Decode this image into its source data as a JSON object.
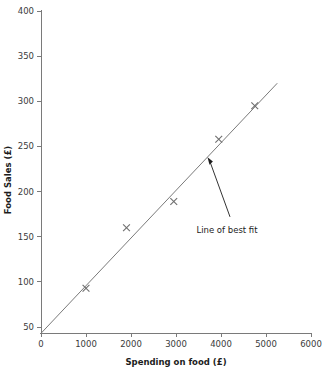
{
  "chart_data": {
    "type": "scatter",
    "title": "",
    "xlabel": "Spending on food (£)",
    "ylabel": "Food Sales (£)",
    "xlim": [
      0,
      6000
    ],
    "ylim": [
      43,
      400
    ],
    "grid": false,
    "legend": "none",
    "x_ticks": [
      0,
      1000,
      2000,
      3000,
      4000,
      5000,
      6000
    ],
    "x_tick_labels": [
      "0",
      "1000",
      "2000",
      "3000",
      "4000",
      "5000",
      "6000"
    ],
    "y_ticks": [
      50,
      100,
      150,
      200,
      250,
      300,
      350,
      400
    ],
    "y_tick_labels": [
      "50",
      "100",
      "150",
      "200",
      "250",
      "300",
      "350",
      "400"
    ],
    "marker": "x",
    "points": [
      {
        "x": 1000,
        "y": 93
      },
      {
        "x": 1900,
        "y": 160
      },
      {
        "x": 2950,
        "y": 189
      },
      {
        "x": 3950,
        "y": 258
      },
      {
        "x": 4750,
        "y": 295
      }
    ],
    "series": [
      {
        "name": "Observations",
        "x": [
          1000,
          1900,
          2950,
          3950,
          4750
        ],
        "values": [
          93,
          160,
          189,
          258,
          295
        ]
      }
    ],
    "trendline": {
      "name": "Line of best fit",
      "x_start": 0,
      "y_start": 43,
      "x_end": 5250,
      "y_end": 320
    },
    "annotations": [
      {
        "text": "Line of best fit",
        "target_x": 3700,
        "target_y": 238,
        "label_x": 4200,
        "label_y": 172
      }
    ],
    "colors": {
      "axis": "#7a7a7a",
      "marker": "#6e6e6e",
      "line": "#7a7a7a",
      "text": "#1c1c1c",
      "background": "#ffffff"
    }
  }
}
